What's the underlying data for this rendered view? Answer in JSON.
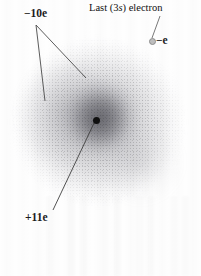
{
  "figure": {
    "background_color": "#ffffff",
    "nucleus_color": "#101010",
    "electron_marker_color": "#bdbdbd",
    "cloud_color": "#6e6e76",
    "leader_line_color": "#4a4a4a"
  },
  "labels": {
    "inner_electrons": {
      "text": "−10e",
      "value": "-10e",
      "x": 24,
      "y": 8
    },
    "last_electron": {
      "text": "Last (3s) electron",
      "prefix": "Last (3",
      "symbol": "s",
      "suffix": ") electron",
      "x": 89,
      "y": 3
    },
    "valence_charge": {
      "text": "−e",
      "value": "-e",
      "x": 156,
      "y": 35
    },
    "nucleus_charge": {
      "text": "+11e",
      "value": "+11e",
      "x": 25,
      "y": 212
    }
  },
  "markers": {
    "nucleus": {
      "name": "nucleus",
      "charge": "+11e",
      "x": 96,
      "y": 120,
      "diameter": 7
    },
    "valence_electron": {
      "name": "last-3s-electron",
      "charge": "-e",
      "x": 152,
      "y": 41,
      "diameter": 5
    }
  },
  "cloud": {
    "outer": {
      "center_x": 98,
      "center_y": 122,
      "radius_x": 89,
      "radius_y": 86
    },
    "inner": {
      "center_x": 103,
      "center_y": 119,
      "radius_x": 42,
      "radius_y": 40
    }
  },
  "leader_lines": [
    {
      "name": "inner-electrons-leader-left",
      "x1": 36,
      "y1": 25,
      "x2": 45,
      "y2": 101
    },
    {
      "name": "inner-electrons-leader-right",
      "x1": 36,
      "y1": 25,
      "x2": 86,
      "y2": 78
    },
    {
      "name": "last-electron-leader",
      "x1": 160,
      "y1": 16,
      "x2": 152,
      "y2": 38
    },
    {
      "name": "nucleus-charge-leader",
      "x1": 95,
      "y1": 121,
      "x2": 53,
      "y2": 210
    }
  ]
}
